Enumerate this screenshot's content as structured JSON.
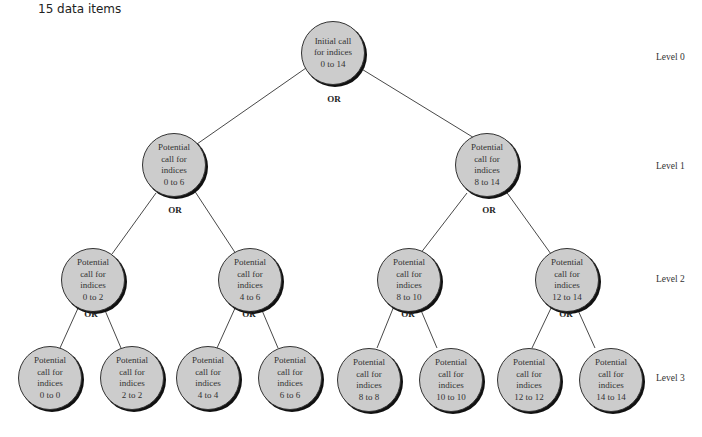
{
  "caption": "15 data items",
  "or_label": "OR",
  "levels": [
    "Level 0",
    "Level 1",
    "Level 2",
    "Level 3"
  ],
  "nodes": [
    {
      "lines": [
        "Initial call",
        "for indices",
        "0 to 14"
      ]
    },
    {
      "lines": [
        "Potential",
        "call for",
        "indices",
        "0 to 6"
      ]
    },
    {
      "lines": [
        "Potential",
        "call for",
        "indices",
        "8 to 14"
      ]
    },
    {
      "lines": [
        "Potential",
        "call for",
        "indices",
        "0 to 2"
      ]
    },
    {
      "lines": [
        "Potential",
        "call for",
        "indices",
        "4 to 6"
      ]
    },
    {
      "lines": [
        "Potential",
        "call for",
        "indices",
        "8 to 10"
      ]
    },
    {
      "lines": [
        "Potential",
        "call for",
        "indices",
        "12 to 14"
      ]
    },
    {
      "lines": [
        "Potential",
        "call for",
        "indices",
        "0 to 0"
      ]
    },
    {
      "lines": [
        "Potential",
        "call for",
        "indices",
        "2 to 2"
      ]
    },
    {
      "lines": [
        "Potential",
        "call for",
        "indices",
        "4 to 4"
      ]
    },
    {
      "lines": [
        "Potential",
        "call for",
        "indices",
        "6 to 6"
      ]
    },
    {
      "lines": [
        "Potential",
        "call for",
        "indices",
        "8 to 8"
      ]
    },
    {
      "lines": [
        "Potential",
        "call for",
        "indices",
        "10 to 10"
      ]
    },
    {
      "lines": [
        "Potential",
        "call for",
        "indices",
        "12 to 12"
      ]
    },
    {
      "lines": [
        "Potential",
        "call for",
        "indices",
        "14 to 14"
      ]
    }
  ]
}
